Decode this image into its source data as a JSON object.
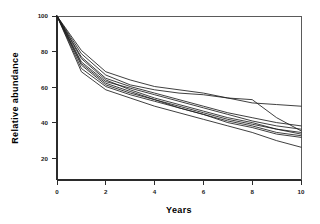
{
  "chart_data": {
    "type": "line",
    "title": "",
    "xlabel": "Years",
    "ylabel": "Relative abundance",
    "xlim": [
      0,
      10
    ],
    "ylim": [
      0,
      100
    ],
    "xticks": [
      0,
      2,
      4,
      6,
      8,
      10
    ],
    "yticks": [
      20,
      40,
      60,
      80,
      100
    ],
    "xticklabels": [
      "0",
      "2",
      "4",
      "6",
      "8",
      "10"
    ],
    "yticklabels": [
      "20",
      "40",
      "60",
      "80",
      "100"
    ],
    "grid": false,
    "legend": "none",
    "line_color": "#1d1d1d",
    "axis_color": "#2b2b2b",
    "background": "#ffffff",
    "x": [
      0,
      1,
      2,
      3,
      4,
      5,
      6,
      7,
      8,
      9,
      10
    ],
    "series": [
      {
        "name": "series-1",
        "values": [
          100,
          79,
          66,
          61,
          57,
          55,
          53,
          50,
          47,
          46,
          45
        ]
      },
      {
        "name": "series-2",
        "values": [
          100,
          77,
          64,
          58,
          55,
          53,
          52,
          50,
          49,
          38,
          30
        ]
      },
      {
        "name": "series-3",
        "values": [
          100,
          75,
          62,
          57,
          53,
          49,
          45,
          41,
          38,
          35,
          33
        ]
      },
      {
        "name": "series-4",
        "values": [
          100,
          72,
          60,
          56,
          52,
          48,
          44,
          40,
          36,
          33,
          31
        ]
      },
      {
        "name": "series-5",
        "values": [
          100,
          70,
          58,
          53,
          49,
          45,
          41,
          37,
          34,
          31,
          29
        ]
      },
      {
        "name": "series-6",
        "values": [
          100,
          74,
          61,
          55,
          50,
          46,
          42,
          38,
          35,
          31,
          28
        ]
      },
      {
        "name": "series-7",
        "values": [
          100,
          68,
          57,
          52,
          48,
          44,
          40,
          36,
          33,
          29,
          27
        ]
      },
      {
        "name": "series-8",
        "values": [
          100,
          71,
          59,
          54,
          49,
          44,
          40,
          35,
          32,
          28,
          26
        ]
      },
      {
        "name": "series-9",
        "values": [
          100,
          66,
          55,
          50,
          45,
          41,
          37,
          33,
          29,
          24,
          20
        ]
      }
    ]
  },
  "labels": {
    "xaxis_title": "Years",
    "yaxis_title": "Relative  abundance",
    "ytick_100": "100",
    "ytick_80": "80",
    "ytick_60": "60",
    "ytick_40": "40",
    "ytick_20": "20",
    "xtick_0": "0",
    "xtick_2": "2",
    "xtick_4": "4",
    "xtick_6": "6",
    "xtick_8": "8",
    "xtick_10": "10"
  }
}
